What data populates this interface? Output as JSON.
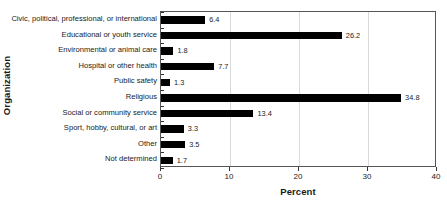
{
  "chart_data": {
    "type": "bar",
    "orientation": "horizontal",
    "title": "",
    "xlabel": "Percent",
    "ylabel": "Organization",
    "xlim": [
      0,
      40
    ],
    "xticks": [
      0,
      10,
      20,
      30,
      40
    ],
    "xtick_labels": [
      "0",
      "10",
      "20",
      "30",
      "40"
    ],
    "grid": true,
    "grid_axis": "x",
    "legend": "none",
    "bar_color": "#000000",
    "categories": [
      "Civic, political, professional, or international",
      "Educational or youth service",
      "Environmental or animal care",
      "Hospital or other health",
      "Public safety",
      "Religious",
      "Social or community service",
      "Sport, hobby, cultural, or art",
      "Other",
      "Not determined"
    ],
    "values": [
      6.4,
      26.2,
      1.8,
      7.7,
      1.3,
      34.8,
      13.4,
      3.3,
      3.5,
      1.7
    ],
    "value_labels": [
      "6.4",
      "26.2",
      "1.8",
      "7.7",
      "1.3",
      "34.8",
      "13.4",
      "3.3",
      "3.5",
      "1.7"
    ]
  }
}
